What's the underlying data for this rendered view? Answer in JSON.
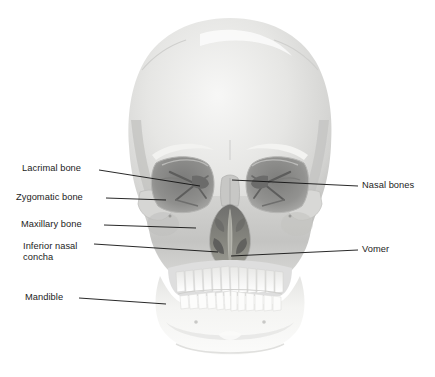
{
  "figure": {
    "background_color": "#ffffff",
    "text_color": "#1c1c1c",
    "leader_line_color": "#111111"
  },
  "labels": {
    "left": [
      {
        "id": "lacrimal-bone",
        "text": "Lacrimal bone",
        "x": 22,
        "y": 163
      },
      {
        "id": "zygomatic-bone",
        "text": "Zygomatic bone",
        "x": 16,
        "y": 192
      },
      {
        "id": "maxillary-bone",
        "text": "Maxillary bone",
        "x": 21,
        "y": 219
      },
      {
        "id": "inferior-nasal-concha",
        "text": "Inferior nasal",
        "x": 23,
        "y": 241
      },
      {
        "id": "inferior-nasal-concha-line2",
        "text": "concha",
        "x": 23,
        "y": 252
      },
      {
        "id": "mandible",
        "text": "Mandible",
        "x": 25,
        "y": 292
      }
    ],
    "right": [
      {
        "id": "nasal-bones",
        "text": "Nasal bones",
        "x": 362,
        "y": 180
      },
      {
        "id": "vomer",
        "text": "Vomer",
        "x": 362,
        "y": 244
      }
    ]
  },
  "colors": {
    "cranium_light": "#eeeeec",
    "cranium_mid": "#dcdcda",
    "cranium_shadow": "#c6c6c4",
    "midface": "#c9c9c7",
    "orbit_dark": "#8e8e8c",
    "orbit_deep": "#6f6f6e",
    "nasal_cavity": "#7e7e7c",
    "teeth": "#fbfbfa",
    "mandible": "#f3f3f1"
  }
}
